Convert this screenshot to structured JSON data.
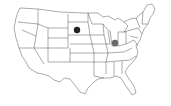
{
  "map": {
    "title": "United States",
    "style": "outline",
    "background": "#ffffff",
    "border_color": "#555555"
  },
  "markers": [
    {
      "label": "South Dakota",
      "x": 77,
      "y": 30,
      "r": 3.2,
      "color": "#222222"
    },
    {
      "label": "Indiana",
      "x": 115,
      "y": 43,
      "r": 3.2,
      "color": "#6a6a6a"
    }
  ]
}
